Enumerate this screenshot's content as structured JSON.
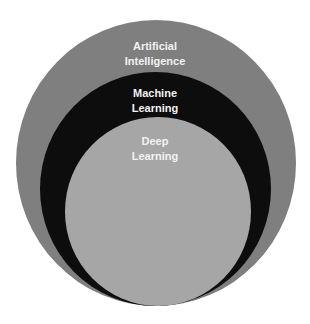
{
  "diagram": {
    "type": "nested-circles",
    "layers": [
      {
        "label_line1": "Artificial",
        "label_line2": "Intelligence",
        "color": "#7f7f7f"
      },
      {
        "label_line1": "Machine",
        "label_line2": "Learning",
        "color": "#0d0d0d"
      },
      {
        "label_line1": "Deep",
        "label_line2": "Learning",
        "color": "#a6a6a6"
      }
    ]
  }
}
